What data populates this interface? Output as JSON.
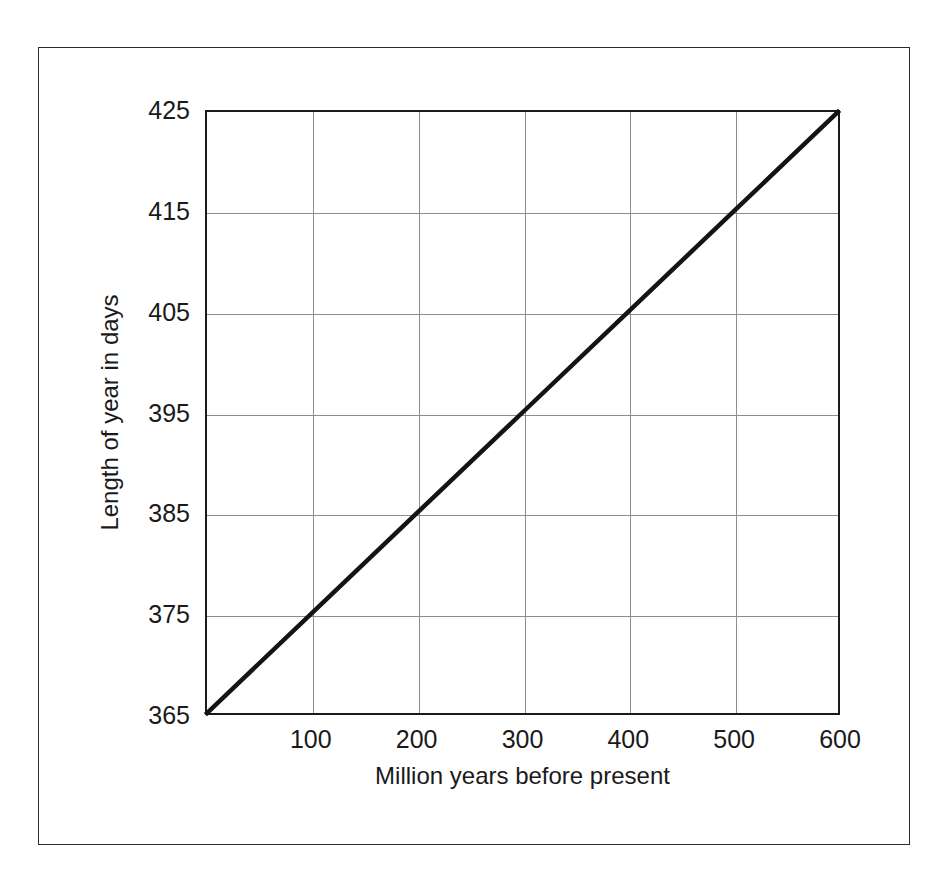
{
  "figure": {
    "background_color": "#ffffff",
    "frame_color": "#2b2b2b",
    "axis_color": "#1b1b1b",
    "grid_color": "#8d8d8d",
    "line_color": "#141414"
  },
  "chart_data": {
    "type": "line",
    "title": "",
    "subtitle": "",
    "xlabel": "Million years before present",
    "ylabel": "Length of year in days",
    "xlim": [
      0,
      600
    ],
    "ylim": [
      365,
      425
    ],
    "grid": true,
    "legend": null,
    "legend_position": "none",
    "xticks": [
      100,
      200,
      300,
      400,
      500,
      600
    ],
    "xtick_labels": [
      "100",
      "200",
      "300",
      "400",
      "500",
      "600"
    ],
    "yticks": [
      365,
      375,
      385,
      395,
      405,
      415,
      425
    ],
    "ytick_labels": [
      "365",
      "375",
      "385",
      "395",
      "405",
      "415",
      "425"
    ],
    "x_gridlines": [
      100,
      200,
      300,
      400,
      500
    ],
    "y_gridlines": [
      375,
      385,
      395,
      405,
      415
    ],
    "series": [
      {
        "name": "Length of year",
        "color": "#141414",
        "line_width": 4.5,
        "x": [
          0,
          100,
          200,
          300,
          400,
          500,
          600
        ],
        "values": [
          365,
          375,
          385,
          395,
          405,
          415,
          425
        ]
      }
    ],
    "annotations": []
  }
}
